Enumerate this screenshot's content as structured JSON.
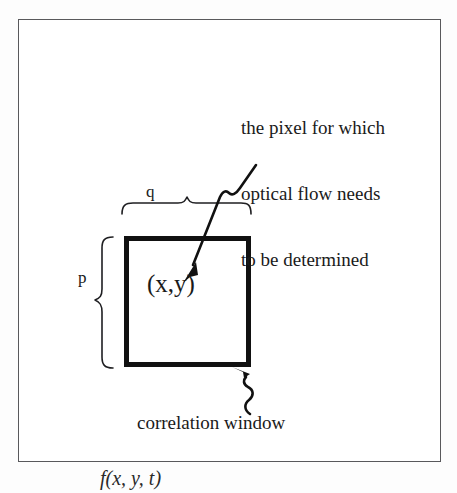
{
  "figure": {
    "caption_below": "f(x, y, t)",
    "callout": {
      "line1": "the pixel for which",
      "line2": "optical flow needs",
      "line3": "to be determined"
    },
    "labels": {
      "width_brace": "q",
      "height_brace": "p",
      "center_point": "(x,y)",
      "window_name": "correlation window"
    },
    "colors": {
      "ink": "#1a1a1a",
      "square_border": "#111111",
      "frame_border": "#59595c",
      "background": "#ffffff"
    }
  }
}
